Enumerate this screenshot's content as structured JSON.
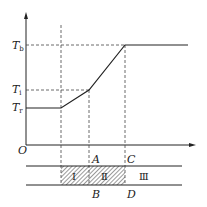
{
  "diagram": {
    "axes": {
      "origin_label": "O",
      "y_ticks": [
        {
          "main": "T",
          "sub": "b"
        },
        {
          "main": "T",
          "sub": "i"
        },
        {
          "main": "T",
          "sub": "r"
        }
      ]
    },
    "band": {
      "top_labels": [
        "A",
        "C"
      ],
      "bottom_labels": [
        "B",
        "D"
      ],
      "zones": [
        "Ⅰ",
        "Ⅱ",
        "Ⅲ"
      ]
    },
    "colors": {
      "line": "#222222",
      "hatch": "#555555",
      "background": "#ffffff"
    }
  }
}
